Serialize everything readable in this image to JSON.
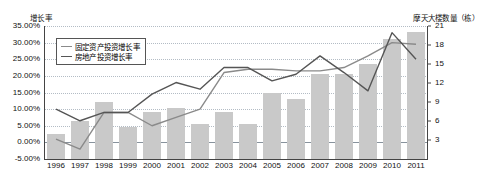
{
  "chart_data": {
    "type": "bar",
    "title": "",
    "subtitle": "",
    "xlabel": "",
    "ylabel": "增长率",
    "y2label": "摩天大楼数量（栋）",
    "categories": [
      "1996",
      "1997",
      "1998",
      "1999",
      "2000",
      "2001",
      "2002",
      "2003",
      "2004",
      "2005",
      "2006",
      "2007",
      "2008",
      "2009",
      "2010",
      "2011"
    ],
    "ylim": [
      -5,
      35
    ],
    "yticks": [
      "-5.00%",
      "0.00%",
      "5.00%",
      "10.00%",
      "15.00%",
      "20.00%",
      "25.00%",
      "30.00%",
      "35.00%"
    ],
    "ytick_values": [
      -5,
      0,
      5,
      10,
      15,
      20,
      25,
      30,
      35
    ],
    "y2lim": [
      0,
      21
    ],
    "y2ticks": [
      "0",
      "3",
      "6",
      "9",
      "12",
      "15",
      "18",
      "21"
    ],
    "y2tick_values": [
      0,
      3,
      6,
      9,
      12,
      15,
      18,
      21
    ],
    "grid": true,
    "legend_position": "top-left",
    "series": [
      {
        "name": "摩天大楼数量（栋）",
        "type": "bar",
        "axis": "right",
        "color": "#c9c9c9",
        "values": [
          4,
          6,
          9,
          5,
          7.5,
          8,
          5.5,
          7.5,
          5.5,
          10.5,
          9.5,
          13.5,
          13.5,
          15,
          19,
          20
        ]
      },
      {
        "name": "固定资产投资增长率",
        "type": "line",
        "axis": "left",
        "color": "#8a8a8a",
        "values": [
          1.0,
          -2.0,
          9.0,
          9.0,
          5.0,
          7.5,
          10.0,
          21.0,
          22.0,
          22.0,
          21.5,
          21.5,
          22.5,
          26.0,
          30.0,
          29.5
        ]
      },
      {
        "name": "房地产投资增长率",
        "type": "line",
        "axis": "left",
        "color": "#555555",
        "values": [
          10.0,
          6.5,
          9.0,
          9.0,
          14.5,
          18.0,
          16.0,
          22.5,
          22.5,
          18.5,
          20.5,
          26.0,
          21.0,
          15.5,
          33.0,
          25.0
        ]
      }
    ]
  },
  "legend": {
    "items": [
      {
        "label": "固定资产投资增长率",
        "color": "#8a8a8a"
      },
      {
        "label": "房地产投资增长率",
        "color": "#555555"
      }
    ]
  }
}
